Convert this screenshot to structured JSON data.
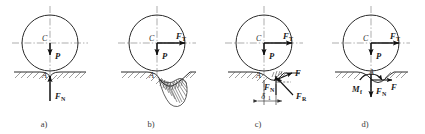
{
  "figure": {
    "panel_count": 4,
    "background_color": "#ffffff",
    "line_color": "#2a2a2a",
    "centerline_color": "#8a8a8a",
    "vector_color": "#111111"
  },
  "panels": [
    {
      "id": "a",
      "caption": "a)",
      "center_label": "C",
      "contact_label": "A",
      "forces": [
        {
          "name": "weight",
          "symbol": "P",
          "subscript": "",
          "direction": "down"
        },
        {
          "name": "normal-force",
          "symbol": "F",
          "subscript": "N",
          "direction": "up"
        }
      ],
      "has_traction": false,
      "has_deformation": false,
      "has_offset_dim": false,
      "has_moment": false
    },
    {
      "id": "b",
      "caption": "b)",
      "center_label": "C",
      "contact_label": "A",
      "forces": [
        {
          "name": "traction-force",
          "symbol": "F",
          "subscript": "T",
          "direction": "right"
        },
        {
          "name": "weight",
          "symbol": "P",
          "subscript": "",
          "direction": "down"
        }
      ],
      "has_traction": true,
      "has_deformation": true,
      "has_offset_dim": false,
      "has_moment": false
    },
    {
      "id": "c",
      "caption": "c)",
      "center_label": "C",
      "contact_label": "A",
      "forces": [
        {
          "name": "traction-force",
          "symbol": "F",
          "subscript": "T",
          "direction": "right"
        },
        {
          "name": "weight",
          "symbol": "P",
          "subscript": "",
          "direction": "down"
        },
        {
          "name": "friction-force",
          "symbol": "F",
          "subscript": "",
          "direction": "up-right"
        },
        {
          "name": "normal-force",
          "symbol": "F",
          "subscript": "N",
          "direction": "up"
        },
        {
          "name": "resultant-reaction",
          "symbol": "F",
          "subscript": "R",
          "direction": "up-left"
        }
      ],
      "dimension": {
        "symbol": "δ",
        "subscript": "1",
        "name": "rolling-resistance-arm"
      },
      "has_traction": true,
      "has_deformation": false,
      "has_offset_dim": true,
      "has_moment": false
    },
    {
      "id": "d",
      "caption": "d)",
      "center_label": "C",
      "contact_label": "A",
      "forces": [
        {
          "name": "traction-force",
          "symbol": "F",
          "subscript": "T",
          "direction": "right"
        },
        {
          "name": "weight",
          "symbol": "P",
          "subscript": "",
          "direction": "down"
        },
        {
          "name": "friction-force",
          "symbol": "F",
          "subscript": "",
          "direction": "right"
        },
        {
          "name": "normal-force",
          "symbol": "F",
          "subscript": "N",
          "direction": "down"
        }
      ],
      "moment": {
        "symbol": "M",
        "subscript": "f",
        "name": "rolling-resistance-moment"
      },
      "has_traction": true,
      "has_deformation": false,
      "has_offset_dim": false,
      "has_moment": true
    }
  ]
}
